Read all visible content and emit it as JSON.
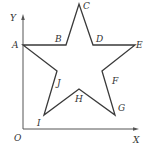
{
  "figure": {
    "type": "coordinate-diagram",
    "shape": "five-pointed star",
    "axes": {
      "origin_label": "O",
      "x_label": "X",
      "y_label": "Y",
      "origin": [
        23,
        129
      ],
      "x_end": [
        138,
        129
      ],
      "y_end": [
        23,
        15
      ]
    },
    "vertices": [
      {
        "label": "A",
        "pos": [
          23,
          45
        ],
        "label_pos": [
          12,
          48
        ]
      },
      {
        "label": "B",
        "pos": [
          66,
          45
        ],
        "label_pos": [
          55,
          41
        ]
      },
      {
        "label": "C",
        "pos": [
          79,
          4
        ],
        "label_pos": [
          83,
          9
        ]
      },
      {
        "label": "D",
        "pos": [
          93,
          45
        ],
        "label_pos": [
          96,
          41
        ]
      },
      {
        "label": "E",
        "pos": [
          135,
          45
        ],
        "label_pos": [
          137,
          48
        ]
      },
      {
        "label": "F",
        "pos": [
          102,
          71
        ],
        "label_pos": [
          112,
          84
        ]
      },
      {
        "label": "G",
        "pos": [
          115,
          115
        ],
        "label_pos": [
          118,
          110
        ]
      },
      {
        "label": "H",
        "pos": [
          79,
          89
        ],
        "label_pos": [
          75,
          101
        ]
      },
      {
        "label": "I",
        "pos": [
          44,
          115
        ],
        "label_pos": [
          36,
          125
        ]
      },
      {
        "label": "J",
        "pos": [
          57,
          71
        ],
        "label_pos": [
          57,
          86
        ]
      }
    ],
    "polygon_order": [
      "A",
      "B",
      "C",
      "D",
      "E",
      "F",
      "G",
      "H",
      "I",
      "J"
    ]
  }
}
